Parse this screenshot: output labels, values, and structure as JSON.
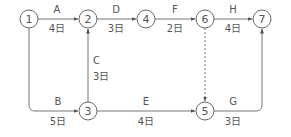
{
  "colors": {
    "stroke": "#666666",
    "text": "#555555",
    "background": "#ffffff"
  },
  "nodes": [
    {
      "id": "1",
      "x": 29,
      "y": 19
    },
    {
      "id": "2",
      "x": 88,
      "y": 19
    },
    {
      "id": "4",
      "x": 146,
      "y": 19
    },
    {
      "id": "6",
      "x": 205,
      "y": 19
    },
    {
      "id": "7",
      "x": 262,
      "y": 19
    },
    {
      "id": "3",
      "x": 88,
      "y": 111
    },
    {
      "id": "5",
      "x": 205,
      "y": 111
    }
  ],
  "edges": [
    {
      "name": "A",
      "duration": "4日",
      "from": "1",
      "to": "2"
    },
    {
      "name": "D",
      "duration": "3日",
      "from": "2",
      "to": "4"
    },
    {
      "name": "F",
      "duration": "2日",
      "from": "4",
      "to": "6"
    },
    {
      "name": "H",
      "duration": "4日",
      "from": "6",
      "to": "7"
    },
    {
      "name": "B",
      "duration": "5日",
      "from": "1",
      "to": "3"
    },
    {
      "name": "C",
      "duration": "3日",
      "from": "3",
      "to": "2"
    },
    {
      "name": "E",
      "duration": "4日",
      "from": "3",
      "to": "5"
    },
    {
      "name": "G",
      "duration": "3日",
      "from": "5",
      "to": "7"
    },
    {
      "name": "",
      "duration": "",
      "from": "6",
      "to": "5",
      "dummy": true
    }
  ]
}
